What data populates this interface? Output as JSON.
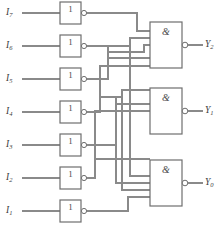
{
  "figure": {
    "width": 216,
    "height": 235,
    "background_color": "#ffffff",
    "wire_color": "#8a8a8a",
    "gate_outline_color": "#6e6e6e",
    "label_color": "#3c3c3c"
  },
  "inverters": [
    {
      "id": "inv7",
      "label": "1",
      "input_label": "I",
      "input_sub": "7",
      "x": 60,
      "y": 2,
      "w": 21,
      "h": 22,
      "inverted_output": true
    },
    {
      "id": "inv6",
      "label": "1",
      "input_label": "I",
      "input_sub": "6",
      "x": 60,
      "y": 35,
      "w": 21,
      "h": 22,
      "inverted_output": true
    },
    {
      "id": "inv5",
      "label": "1",
      "input_label": "I",
      "input_sub": "5",
      "x": 60,
      "y": 68,
      "w": 21,
      "h": 22,
      "inverted_output": true
    },
    {
      "id": "inv4",
      "label": "1",
      "input_label": "I",
      "input_sub": "4",
      "x": 60,
      "y": 101,
      "w": 21,
      "h": 22,
      "inverted_output": true
    },
    {
      "id": "inv3",
      "label": "1",
      "input_label": "I",
      "input_sub": "3",
      "x": 60,
      "y": 134,
      "w": 21,
      "h": 22,
      "inverted_output": true
    },
    {
      "id": "inv2",
      "label": "1",
      "input_label": "I",
      "input_sub": "2",
      "x": 60,
      "y": 167,
      "w": 21,
      "h": 22,
      "inverted_output": true
    },
    {
      "id": "inv1",
      "label": "1",
      "input_label": "I",
      "input_sub": "1",
      "x": 60,
      "y": 200,
      "w": 21,
      "h": 22,
      "inverted_output": true
    }
  ],
  "and_gates": [
    {
      "id": "nand2",
      "label": "&",
      "output_label": "Y",
      "output_sub": "2",
      "x": 150,
      "y": 22,
      "w": 32,
      "h": 46,
      "input_count": 4,
      "inverted_output": true
    },
    {
      "id": "nand1",
      "label": "&",
      "output_label": "Y",
      "output_sub": "1",
      "x": 150,
      "y": 88,
      "w": 32,
      "h": 46,
      "input_count": 4,
      "inverted_output": true
    },
    {
      "id": "nand0",
      "label": "&",
      "output_label": "Y",
      "output_sub": "0",
      "x": 150,
      "y": 160,
      "w": 32,
      "h": 46,
      "input_count": 4,
      "inverted_output": true
    }
  ],
  "inputs": [
    {
      "name": "I7",
      "label": "I",
      "sub": "7",
      "y": 13
    },
    {
      "name": "I6",
      "label": "I",
      "sub": "6",
      "y": 46
    },
    {
      "name": "I5",
      "label": "I",
      "sub": "5",
      "y": 79
    },
    {
      "name": "I4",
      "label": "I",
      "sub": "4",
      "y": 112
    },
    {
      "name": "I3",
      "label": "I",
      "sub": "3",
      "y": 145
    },
    {
      "name": "I2",
      "label": "I",
      "sub": "2",
      "y": 178
    },
    {
      "name": "I1",
      "label": "I",
      "sub": "1",
      "y": 211
    }
  ],
  "outputs": [
    {
      "name": "Y2",
      "label": "Y",
      "sub": "2",
      "y": 45
    },
    {
      "name": "Y1",
      "label": "Y",
      "sub": "1",
      "y": 111
    },
    {
      "name": "Y0",
      "label": "Y",
      "sub": "0",
      "y": 183
    }
  ],
  "legend": {
    "inverter_symbol": "1",
    "and_symbol": "&"
  }
}
